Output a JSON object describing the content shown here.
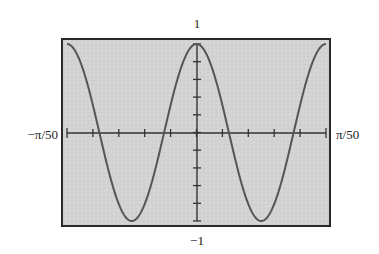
{
  "chart_data": {
    "type": "line",
    "title": "",
    "function": "cos(100x)",
    "xlabel": "",
    "ylabel": "",
    "xlim": [
      -0.0628319,
      0.0628319
    ],
    "ylim": [
      -1,
      1
    ],
    "x_tick_labels": {
      "left": "−π/50",
      "right": "π/50"
    },
    "y_tick_labels": {
      "top": "1",
      "bottom": "−1"
    },
    "x_ticks_count": 11,
    "y_ticks_count": 11,
    "grid": false,
    "legend": null,
    "series": [
      {
        "name": "y = cos(100x)",
        "x": [
          -0.0628319,
          -0.0471239,
          -0.0314159,
          -0.015708,
          0,
          0.015708,
          0.0314159,
          0.0471239,
          0.0628319
        ],
        "values": [
          1,
          0,
          -1,
          0,
          1,
          0,
          -1,
          0,
          1
        ]
      }
    ],
    "colors": {
      "background": "#d2d2d2",
      "frame": "#2a2a2a",
      "curve": "#555555",
      "axes": "#333333"
    }
  }
}
